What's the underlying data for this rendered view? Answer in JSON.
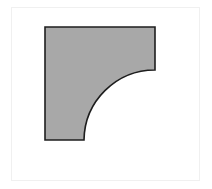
{
  "canvas": {
    "width": 212,
    "height": 189,
    "background_color": "#ffffff",
    "frame": {
      "x": 11,
      "y": 7,
      "width": 189,
      "height": 174,
      "border_color": "#f0f0f0",
      "border_width": 1
    }
  },
  "figure": {
    "name": "quarter-circle-fillet-square",
    "fill_color": "#a8a8a8",
    "stroke_color": "#1e1e1e",
    "stroke_width": 1.6,
    "square": {
      "left": 45,
      "top": 27,
      "right": 155,
      "bottom": 140,
      "width": 110,
      "height": 113
    },
    "arc": {
      "center_x": 84,
      "center_y": 70,
      "radius": 71,
      "start_x": 155,
      "start_y": 70,
      "end_x": 84,
      "end_y": 140,
      "sweep": "concave",
      "large_arc": 0,
      "sweep_flag": 0
    },
    "vertices": [
      {
        "x": 45,
        "y": 27
      },
      {
        "x": 155,
        "y": 27
      },
      {
        "x": 155,
        "y": 70
      },
      {
        "x": 84,
        "y": 140
      },
      {
        "x": 45,
        "y": 140
      }
    ],
    "path_d": "M 45 27 L 155 27 L 155 70 A 71 71 0 0 0 84 140 L 45 140 Z"
  }
}
